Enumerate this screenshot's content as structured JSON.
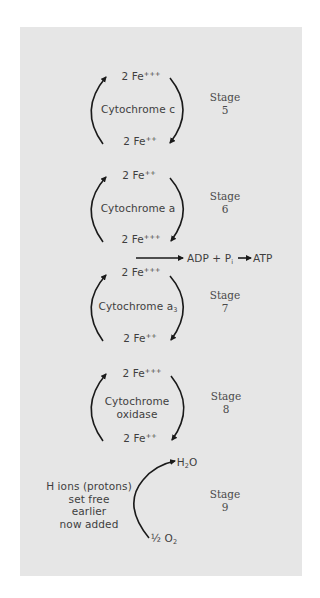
{
  "diagram": {
    "title": "",
    "stages": [
      {
        "id": 5,
        "label": "Stage",
        "number": "5",
        "top": {
          "base": "2 Fe",
          "sup": "+++"
        },
        "carrier": [
          "Cytochrome c"
        ],
        "bottom": {
          "base": "2 Fe",
          "sup": "++"
        }
      },
      {
        "id": 6,
        "label": "Stage",
        "number": "6",
        "top": {
          "base": "2 Fe",
          "sup": "++"
        },
        "carrier": [
          "Cytochrome a"
        ],
        "bottom": {
          "base": "2 Fe",
          "sup": "+++"
        }
      },
      {
        "id": 7,
        "label": "Stage",
        "number": "7",
        "top": {
          "base": "2 Fe",
          "sup": "+++"
        },
        "carrier_base": "Cytochrome a",
        "carrier_sub": "3",
        "bottom": {
          "base": "2 Fe",
          "sup": "++"
        }
      },
      {
        "id": 8,
        "label": "Stage",
        "number": "8",
        "top": {
          "base": "2 Fe",
          "sup": "+++"
        },
        "carrier": [
          "Cytochrome",
          "oxidase"
        ],
        "bottom": {
          "base": "2 Fe",
          "sup": "++"
        }
      },
      {
        "id": 9,
        "label": "Stage",
        "number": "9",
        "note": [
          "H ions (protons)",
          "set free",
          "earlier",
          "now added"
        ],
        "product": {
          "base": "H",
          "sub": "2",
          "rest": "O"
        },
        "reactant": {
          "frac": "½",
          "base": " O",
          "sub": "2"
        }
      }
    ],
    "atp_reaction": {
      "adp": "ADP",
      "plus": "+",
      "pi_base": "P",
      "pi_sub": "i",
      "atp": "ATP"
    },
    "colors": {
      "background": "#ffffff",
      "panel": "#e6e6e6",
      "text": "#3e3e3e",
      "arrow": "#1a1a1a"
    }
  }
}
